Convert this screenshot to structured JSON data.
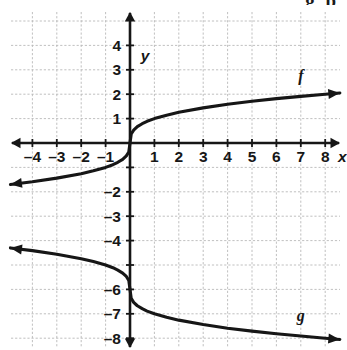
{
  "figure": {
    "kind": "coordinate-plane-graph",
    "partial_header_text": "g  p",
    "axes": {
      "x_axis_label": "x",
      "y_axis_label": "y",
      "x_tick_labels": [
        "–4",
        "–3",
        "–2",
        "–1",
        "1",
        "2",
        "3",
        "4",
        "5",
        "6",
        "7",
        "8"
      ],
      "y_tick_labels": [
        "4",
        "3",
        "2",
        "1",
        "–2",
        "–3",
        "–4",
        "–6",
        "–7",
        "–8"
      ],
      "x_axis_arrow_left": true,
      "x_axis_arrow_right": true,
      "y_axis_arrow_up": true,
      "y_axis_arrow_down": true
    },
    "curve_labels": [
      {
        "name": "f",
        "text": "f"
      },
      {
        "name": "g",
        "text": "g"
      }
    ],
    "colors": {
      "grid": "#b9b9b9",
      "axis": "#161616",
      "curve": "#161616",
      "text": "#161616",
      "background": "#ffffff"
    }
  },
  "chart_data": {
    "type": "line",
    "title": "",
    "subtitle": "",
    "xlabel": "x",
    "ylabel": "y",
    "xlim": [
      -4.9,
      8.6
    ],
    "ylim": [
      -8.6,
      4.6
    ],
    "xticks": [
      -4,
      -3,
      -2,
      -1,
      1,
      2,
      3,
      4,
      5,
      6,
      7,
      8
    ],
    "yticks": [
      4,
      3,
      2,
      1,
      -2,
      -3,
      -4,
      -6,
      -7,
      -8
    ],
    "xtick_labels": [
      "–4",
      "–3",
      "–2",
      "–1",
      "1",
      "2",
      "3",
      "4",
      "5",
      "6",
      "7",
      "8"
    ],
    "ytick_labels": [
      "4",
      "3",
      "2",
      "1",
      "–2",
      "–3",
      "–4",
      "–6",
      "–7",
      "–8"
    ],
    "unlabeled_yticks": [
      -1,
      -5
    ],
    "grid": true,
    "grid_style": "dashed",
    "grid_spacing": 1,
    "legend": "inline-curve-labels",
    "series": [
      {
        "name": "f",
        "label": "f",
        "equation": "f(x) = cbrt(x)",
        "label_position": {
          "x": 7.0,
          "y": 2.55
        },
        "arrow_start": true,
        "arrow_end": true,
        "x": [
          -4.9,
          -4.0,
          -3.0,
          -2.0,
          -1.5,
          -1.0,
          -0.7,
          -0.5,
          -0.3,
          -0.15,
          -0.05,
          0,
          0.05,
          0.15,
          0.3,
          0.5,
          0.7,
          1.0,
          1.5,
          2.0,
          3.0,
          4.0,
          5.0,
          6.0,
          7.0,
          8.0,
          8.6
        ],
        "y": [
          -1.7,
          -1.59,
          -1.44,
          -1.26,
          -1.14,
          -1.0,
          -0.89,
          -0.79,
          -0.67,
          -0.53,
          -0.37,
          0,
          0.37,
          0.53,
          0.67,
          0.79,
          0.89,
          1.0,
          1.14,
          1.26,
          1.44,
          1.59,
          1.71,
          1.82,
          1.91,
          2.0,
          2.05
        ]
      },
      {
        "name": "g",
        "label": "g",
        "equation": "g(x) = -cbrt(x) - 6",
        "label_position": {
          "x": 7.0,
          "y": -7.3
        },
        "arrow_start": true,
        "arrow_end": true,
        "x": [
          -4.9,
          -4.0,
          -3.0,
          -2.0,
          -1.5,
          -1.0,
          -0.7,
          -0.5,
          -0.3,
          -0.15,
          -0.05,
          0,
          0.05,
          0.15,
          0.3,
          0.5,
          0.7,
          1.0,
          1.5,
          2.0,
          3.0,
          4.0,
          5.0,
          6.0,
          7.0,
          8.0,
          8.6
        ],
        "y": [
          -4.3,
          -4.41,
          -4.56,
          -4.74,
          -4.86,
          -5.0,
          -5.11,
          -5.21,
          -5.33,
          -5.47,
          -5.63,
          -6.0,
          -6.37,
          -6.53,
          -6.67,
          -6.79,
          -6.89,
          -7.0,
          -7.14,
          -7.26,
          -7.44,
          -7.59,
          -7.71,
          -7.82,
          -7.91,
          -8.0,
          -8.05
        ]
      }
    ]
  }
}
